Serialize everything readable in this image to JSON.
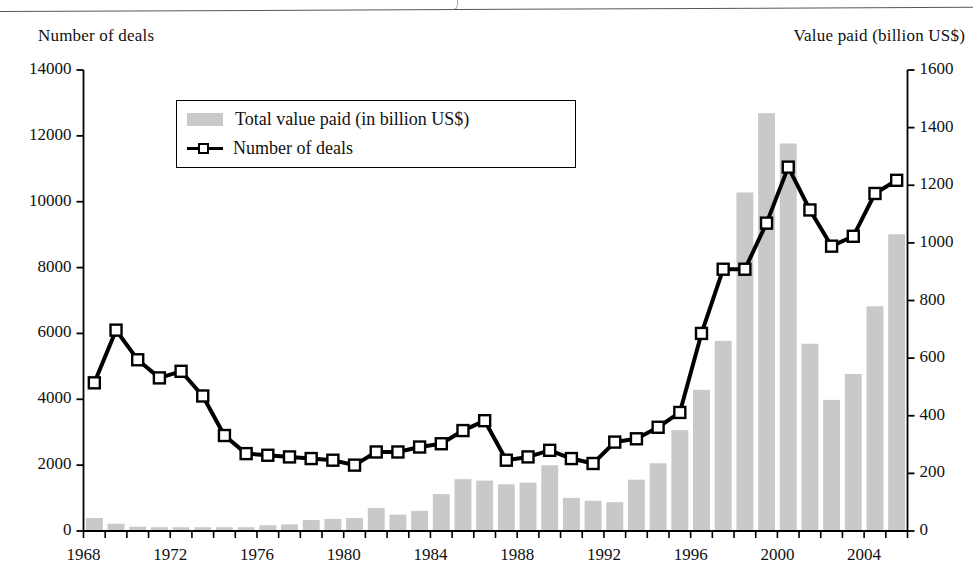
{
  "figure": {
    "left_axis_title": "Number of deals",
    "right_axis_title": "Value paid (billion US$)"
  },
  "legend": {
    "bars_label": "Total value paid (in billion US$)",
    "line_label": "Number of deals",
    "bar_swatch_color": "#c9c9c9",
    "line_swatch_color": "#000000"
  },
  "chart_data": {
    "type": "bar",
    "title": "",
    "xlabel": "",
    "ylabel": "Number of deals",
    "y2label": "Value paid (billion US$)",
    "ylim": [
      0,
      14000
    ],
    "y2lim": [
      0,
      1600
    ],
    "ytick_step": 2000,
    "y2tick_step": 200,
    "yticks": [
      0,
      2000,
      4000,
      6000,
      8000,
      10000,
      12000,
      14000
    ],
    "y2ticks": [
      0,
      200,
      400,
      600,
      800,
      1000,
      1200,
      1400,
      1600
    ],
    "grid": false,
    "legend_position": "upper-left-inside",
    "bar_color": "#c9c9c9",
    "line_color": "#000000",
    "marker": "open-square",
    "x": [
      1968,
      1969,
      1970,
      1971,
      1972,
      1973,
      1974,
      1975,
      1976,
      1977,
      1978,
      1979,
      1980,
      1981,
      1982,
      1983,
      1984,
      1985,
      1986,
      1987,
      1988,
      1989,
      1990,
      1991,
      1992,
      1993,
      1994,
      1995,
      1996,
      1997,
      1998,
      1999,
      2000,
      2001,
      2002,
      2003,
      2004,
      2005
    ],
    "xtick_labels": [
      1968,
      1972,
      1976,
      1980,
      1984,
      1988,
      1992,
      1996,
      2000,
      2004
    ],
    "series": [
      {
        "name": "Total value paid (in billion US$)",
        "axis": "right",
        "type": "bar",
        "values": [
          45,
          25,
          15,
          13,
          13,
          13,
          13,
          13,
          20,
          23,
          38,
          42,
          45,
          80,
          57,
          70,
          128,
          180,
          175,
          162,
          168,
          228,
          115,
          105,
          100,
          178,
          235,
          350,
          490,
          660,
          1175,
          1450,
          1345,
          650,
          455,
          545,
          780,
          1030
        ]
      },
      {
        "name": "Number of deals",
        "axis": "left",
        "type": "line",
        "values": [
          4500,
          6100,
          5200,
          4650,
          4850,
          4100,
          2900,
          2350,
          2300,
          2250,
          2200,
          2150,
          2000,
          2400,
          2400,
          2550,
          2650,
          3050,
          3350,
          2150,
          2250,
          2450,
          2200,
          2050,
          2700,
          2800,
          3150,
          3600,
          6000,
          7950,
          7950,
          9350,
          11050,
          9750,
          8650,
          8950,
          10250,
          10650
        ]
      }
    ]
  }
}
